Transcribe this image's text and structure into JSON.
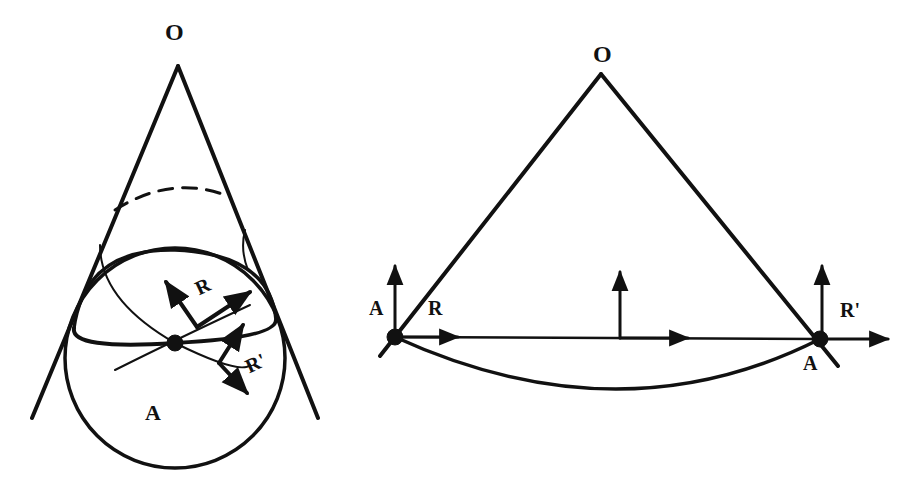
{
  "figure": {
    "left_panel": {
      "apex_label": "O",
      "region_label": "A",
      "vector_labels": [
        "R",
        "R'"
      ]
    },
    "right_panel": {
      "apex_label": "O",
      "left_point_label": "A",
      "right_point_label": "A",
      "vector_labels": [
        "R",
        "R'"
      ]
    },
    "colors": {
      "ink": "#111111",
      "background": "#ffffff"
    }
  }
}
